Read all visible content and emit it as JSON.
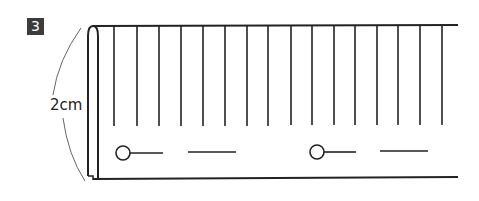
{
  "step": {
    "number": "3"
  },
  "dimension": {
    "label": "2cm"
  },
  "colors": {
    "line": "#222222",
    "badge_bg": "#3c3c3c",
    "badge_text": "#ffffff",
    "arc": "#555555"
  },
  "diagram": {
    "vertical_lines_x": [
      114,
      137,
      159,
      181,
      203,
      225,
      247,
      268,
      291,
      312,
      334,
      355,
      377,
      398,
      420,
      442
    ],
    "buttonholes": [
      {
        "circle_cx": 123,
        "cy": 153,
        "line_x2": 163,
        "dash_x1": 188,
        "dash_x2": 236
      },
      {
        "circle_cx": 317,
        "cy": 152,
        "line_x2": 356,
        "dash_x1": 380,
        "dash_x2": 428
      }
    ]
  }
}
